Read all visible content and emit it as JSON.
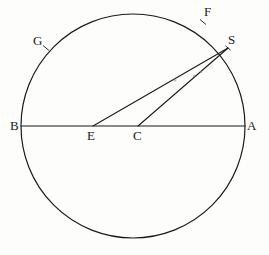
{
  "figure": {
    "kind": "geometry-diagram",
    "canvas": {
      "width": 269,
      "height": 255
    },
    "background_color": "#fdfdfc",
    "ink_color": "#1b1b1b",
    "stroke_width": 1.1
  },
  "circle": {
    "name": "main-circle",
    "center_x": 133,
    "center_y": 126,
    "radius": 112,
    "stroke_color": "#1b1b1b",
    "stroke_width": 1.2,
    "fill": "none"
  },
  "segments": [
    {
      "name": "diameter-ba",
      "from": "B",
      "to": "A",
      "x1": 21,
      "y1": 126,
      "x2": 245,
      "y2": 126,
      "style": "solid",
      "stroke_width": 1.2
    },
    {
      "name": "segment-es",
      "from": "E",
      "to": "S",
      "x1": 93,
      "y1": 126,
      "x2": 228,
      "y2": 48,
      "style": "solid",
      "stroke_width": 1.1
    },
    {
      "name": "segment-cs",
      "from": "C",
      "to": "S",
      "x1": 138,
      "y1": 126,
      "x2": 228,
      "y2": 48,
      "style": "solid",
      "stroke_width": 1.1
    }
  ],
  "tick_marks": [
    {
      "name": "tick-f",
      "x": 203,
      "y": 22,
      "angle_deg": 40,
      "length": 7
    },
    {
      "name": "tick-g",
      "x": 46,
      "y": 48,
      "angle_deg": 40,
      "length": 7
    },
    {
      "name": "tick-s",
      "x": 228,
      "y": 48,
      "angle_deg": 40,
      "length": 6
    }
  ],
  "scan_marks": [
    {
      "name": "scan-speck-1",
      "x": 175,
      "y": 80,
      "r": 1.5
    },
    {
      "name": "scan-speck-2",
      "x": 194,
      "y": 76,
      "r": 1.3
    },
    {
      "name": "scan-speck-3",
      "x": 201,
      "y": 72,
      "r": 1.2
    }
  ],
  "labels": [
    {
      "key": "A",
      "text": "A",
      "x": 247,
      "y": 119,
      "point_x": 245,
      "point_y": 126,
      "description": "right end of diameter on circle"
    },
    {
      "key": "B",
      "text": "B",
      "x": 10,
      "y": 119,
      "point_x": 21,
      "point_y": 126,
      "description": "left end of diameter on circle"
    },
    {
      "key": "C",
      "text": "C",
      "x": 133,
      "y": 129,
      "point_x": 138,
      "point_y": 126,
      "description": "centre of circle on diameter"
    },
    {
      "key": "E",
      "text": "E",
      "x": 87,
      "y": 129,
      "point_x": 93,
      "point_y": 126,
      "description": "point on diameter left of centre"
    },
    {
      "key": "F",
      "text": "F",
      "x": 204,
      "y": 5,
      "point_x": 203,
      "point_y": 22,
      "description": "point on upper right arc"
    },
    {
      "key": "G",
      "text": "G",
      "x": 33,
      "y": 34,
      "point_x": 46,
      "point_y": 48,
      "description": "point on upper left arc"
    },
    {
      "key": "S",
      "text": "S",
      "x": 228,
      "y": 33,
      "point_x": 228,
      "point_y": 48,
      "description": "point on circle where segments ES and CS meet"
    }
  ]
}
